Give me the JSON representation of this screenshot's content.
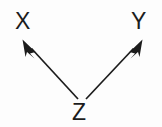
{
  "diagram": {
    "type": "directed-acyclic-graph",
    "background_color": "#fdfdfd",
    "ink_color": "#1c1c1c",
    "nodes": [
      {
        "id": "X",
        "label": "X",
        "x": 24,
        "y": 22
      },
      {
        "id": "Y",
        "label": "Y",
        "x": 140,
        "y": 22
      },
      {
        "id": "Z",
        "label": "Z",
        "x": 81,
        "y": 113
      }
    ],
    "edges": [
      {
        "id": "edge-z-x",
        "from": "Z",
        "to": "X",
        "direction": "Z-to-X",
        "arrowhead": "filled-triangle",
        "tip_x": 23,
        "tip_y": 40,
        "tail_x": 78,
        "tail_y": 99
      },
      {
        "id": "edge-z-y",
        "from": "Z",
        "to": "Y",
        "direction": "Z-to-Y",
        "arrowhead": "filled-triangle",
        "tip_x": 142,
        "tip_y": 40,
        "tail_x": 86,
        "tail_y": 99
      }
    ]
  }
}
